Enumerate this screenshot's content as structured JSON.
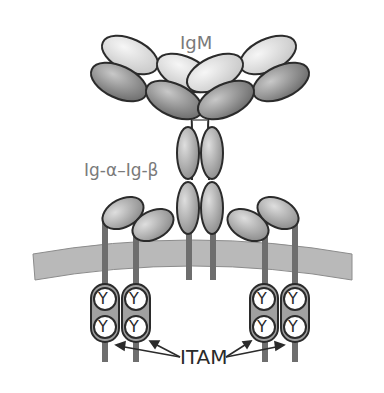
{
  "labels": {
    "igm": "IgM",
    "ig_alpha_beta": "Ig-α–Ig-β",
    "itam": "ITAM"
  },
  "itam_motif": "Y",
  "colors": {
    "background": "#ffffff",
    "outline": "#2b2b2b",
    "membrane_fill": "#b9b9b9",
    "membrane_edge": "#8c8c8c",
    "stalk": "#6e6e6e",
    "domain_light": "#e6e6e6",
    "domain_mid": "#b5b5b5",
    "domain_dark": "#8f8f8f",
    "itam_box": "#a0a0a0",
    "label_grey": "#7a7a7a",
    "label_dark": "#2a2a2a"
  }
}
